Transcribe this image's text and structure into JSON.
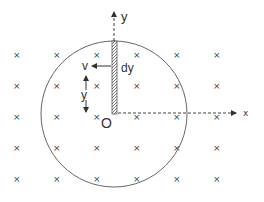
{
  "diagram": {
    "labels": {
      "y_axis": "y",
      "x_axis": "x",
      "origin": "O",
      "velocity": "v",
      "element": "dy",
      "distance": "y"
    },
    "field": {
      "symbol": "×",
      "direction": "into page",
      "columns_x": [
        16,
        56,
        96,
        136,
        176,
        216
      ],
      "rows_y": [
        55,
        86,
        117,
        148,
        179
      ],
      "extra_marks": [
        [
          246,
          112
        ]
      ]
    },
    "circle": {
      "cx": 114,
      "cy": 114,
      "r": 73
    },
    "rod": {
      "x": 114,
      "y_top": 41,
      "y_bottom": 114
    },
    "colors": {
      "stroke": "#555555",
      "text": "#333333",
      "rod_fill": "#888888"
    }
  }
}
